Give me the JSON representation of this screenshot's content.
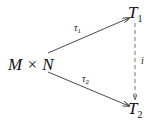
{
  "diagram": {
    "nodes": {
      "source": {
        "base": "M × N"
      },
      "top": {
        "base": "T",
        "sub": "1"
      },
      "bottom": {
        "base": "T",
        "sub": "2"
      }
    },
    "edges": [
      {
        "from": "M × N",
        "to": "T1",
        "label_base": "τ",
        "label_sub": "1",
        "style": "solid"
      },
      {
        "from": "M × N",
        "to": "T2",
        "label_base": "τ",
        "label_sub": "2",
        "style": "solid"
      },
      {
        "from": "T1",
        "to": "T2",
        "label": "i",
        "style": "dashed"
      }
    ]
  }
}
